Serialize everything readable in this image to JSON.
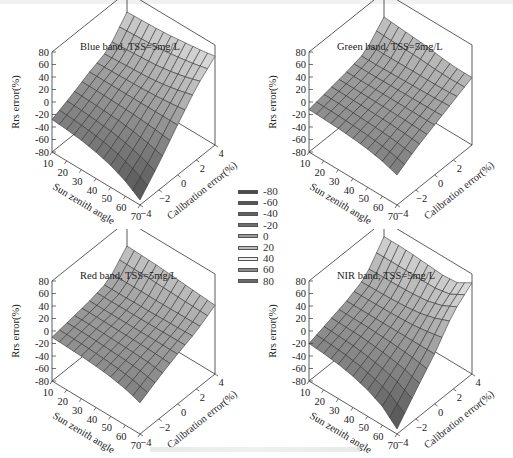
{
  "figure": {
    "colorbar": {
      "levels": [
        "-80",
        "-60",
        "-40",
        "-20",
        "0",
        "20",
        "40",
        "60",
        "80"
      ],
      "colors": [
        "#4a4a4a",
        "#565656",
        "#616161",
        "#6e6e6e",
        "#9a9a9a",
        "#bdbdbd",
        "#efefef",
        "#8c8c8c",
        "#6a6a6a"
      ]
    }
  },
  "chart_data": [
    {
      "type": "surface3d",
      "title": "Blue band,  TSS=5mg/L",
      "xlabel": "Sun zenith angle",
      "ylabel": "Calibration error(%)",
      "zlabel": "Rrs error(%)",
      "x_ticks": [
        "10",
        "20",
        "30",
        "40",
        "50",
        "60",
        "70"
      ],
      "y_ticks": [
        "-4",
        "-2",
        "0",
        "2",
        "4"
      ],
      "z_ticks": [
        "80",
        "60",
        "40",
        "20",
        "0",
        "-20",
        "-40",
        "-60",
        "-80"
      ],
      "x": [
        10,
        20,
        30,
        40,
        50,
        60,
        70
      ],
      "y": [
        -4,
        -2,
        0,
        2,
        4
      ],
      "zlim": [
        -80,
        80
      ],
      "z_corners": {
        "x10_y-4": -28,
        "x70_y-4": -72,
        "x10_y4": 48,
        "x70_y4": 62
      },
      "z": [
        [
          -28,
          -15,
          0,
          12,
          48
        ],
        [
          -30,
          -16,
          0,
          14,
          49
        ],
        [
          -33,
          -18,
          0,
          16,
          50
        ],
        [
          -38,
          -20,
          0,
          18,
          52
        ],
        [
          -45,
          -24,
          0,
          22,
          55
        ],
        [
          -56,
          -30,
          0,
          28,
          58
        ],
        [
          -72,
          -38,
          0,
          36,
          62
        ]
      ]
    },
    {
      "type": "surface3d",
      "title": "Green band,  TSS=5mg/L",
      "xlabel": "Sun zenith angle",
      "ylabel": "Calibration error(%)",
      "zlabel": "Rrs error(%)",
      "x_ticks": [
        "10",
        "20",
        "30",
        "40",
        "50",
        "60",
        "70"
      ],
      "y_ticks": [
        "-4",
        "-2",
        "0",
        "2"
      ],
      "z_ticks": [
        "80",
        "60",
        "40",
        "20",
        "0",
        "-20",
        "-40",
        "-60",
        "-80"
      ],
      "x": [
        10,
        20,
        30,
        40,
        50,
        60,
        70
      ],
      "y": [
        -4,
        -2,
        0,
        2,
        4
      ],
      "zlim": [
        -80,
        80
      ],
      "z": [
        [
          -12,
          -6,
          0,
          8,
          40
        ],
        [
          -13,
          -6,
          0,
          8,
          38
        ],
        [
          -14,
          -7,
          0,
          9,
          36
        ],
        [
          -16,
          -8,
          0,
          10,
          34
        ],
        [
          -19,
          -9,
          0,
          11,
          30
        ],
        [
          -24,
          -11,
          0,
          12,
          28
        ],
        [
          -32,
          -14,
          0,
          14,
          28
        ]
      ]
    },
    {
      "type": "surface3d",
      "title": "Red band,   TSS=5mg/L",
      "xlabel": "Sun zenith angle",
      "ylabel": "Calibration error(%)",
      "zlabel": "Rrs error(%)",
      "x_ticks": [
        "10",
        "20",
        "30",
        "40",
        "50",
        "60",
        "70"
      ],
      "y_ticks": [
        "-4",
        "-2",
        "0",
        "2",
        "4"
      ],
      "z_ticks": [
        "80",
        "60",
        "40",
        "20",
        "0",
        "-20",
        "-40",
        "-60",
        "-80"
      ],
      "x": [
        10,
        20,
        30,
        40,
        50,
        60,
        70
      ],
      "y": [
        -4,
        -2,
        0,
        2,
        4
      ],
      "zlim": [
        -80,
        80
      ],
      "z": [
        [
          -10,
          -5,
          0,
          8,
          40
        ],
        [
          -11,
          -5,
          0,
          8,
          39
        ],
        [
          -12,
          -6,
          0,
          9,
          38
        ],
        [
          -14,
          -7,
          0,
          9,
          36
        ],
        [
          -17,
          -8,
          0,
          10,
          34
        ],
        [
          -22,
          -10,
          0,
          11,
          32
        ],
        [
          -30,
          -14,
          0,
          12,
          30
        ]
      ]
    },
    {
      "type": "surface3d",
      "title": "NIR band,  TSS=5mg/L",
      "xlabel": "Sun zenith angle",
      "ylabel": "Calibration error(%)",
      "zlabel": "Rrs error(%)",
      "x_ticks": [
        "10",
        "20",
        "30",
        "40",
        "50",
        "60",
        "70"
      ],
      "y_ticks": [
        "-4",
        "-2",
        "0",
        "2",
        "4"
      ],
      "z_ticks": [
        "80",
        "60",
        "40",
        "20",
        "0",
        "-20",
        "-40",
        "-60",
        "-80"
      ],
      "x": [
        10,
        20,
        30,
        40,
        50,
        60,
        70
      ],
      "y": [
        -4,
        -2,
        0,
        2,
        4
      ],
      "zlim": [
        -80,
        80
      ],
      "z": [
        [
          -20,
          -10,
          0,
          14,
          55
        ],
        [
          -22,
          -11,
          0,
          15,
          55
        ],
        [
          -25,
          -12,
          0,
          16,
          54
        ],
        [
          -30,
          -15,
          0,
          18,
          52
        ],
        [
          -38,
          -19,
          0,
          22,
          50
        ],
        [
          -50,
          -25,
          0,
          30,
          52
        ],
        [
          -72,
          -35,
          0,
          42,
          66
        ]
      ]
    }
  ]
}
